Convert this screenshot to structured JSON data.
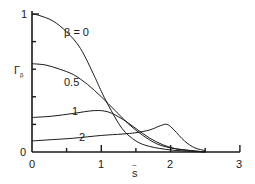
{
  "chart_data": {
    "type": "line",
    "title": "",
    "xlabel": "s̄",
    "ylabel": "Γ_β",
    "xlim": [
      0,
      3
    ],
    "ylim": [
      0,
      1
    ],
    "x_ticks": [
      0,
      1,
      2,
      3
    ],
    "x_minor_ticks": [
      0.5,
      1.5,
      2.5
    ],
    "y_ticks_labeled": [
      0,
      1
    ],
    "y_minor_ticks": [
      0.2,
      0.4,
      0.6,
      0.8
    ],
    "grid": false,
    "legend": "inline curve labels",
    "series": [
      {
        "name": "β = 0",
        "label": "β = 0",
        "x": [
          0,
          0.1,
          0.3,
          0.5,
          0.7,
          0.9,
          1.0,
          1.1,
          1.3,
          1.5,
          1.7,
          2.0,
          2.3,
          2.5
        ],
        "y": [
          1.0,
          0.99,
          0.95,
          0.87,
          0.75,
          0.55,
          0.44,
          0.34,
          0.17,
          0.08,
          0.04,
          0.015,
          0.005,
          0.0
        ]
      },
      {
        "name": "β = 0.5",
        "label": "0.5",
        "x": [
          0,
          0.2,
          0.4,
          0.6,
          0.8,
          1.0,
          1.2,
          1.4,
          1.6,
          1.8,
          2.0,
          2.3,
          2.5
        ],
        "y": [
          0.64,
          0.63,
          0.6,
          0.56,
          0.49,
          0.4,
          0.3,
          0.2,
          0.12,
          0.06,
          0.03,
          0.01,
          0.0
        ]
      },
      {
        "name": "β = 1",
        "label": "1",
        "x": [
          0,
          0.3,
          0.6,
          0.9,
          1.1,
          1.3,
          1.5,
          1.7,
          1.9,
          2.1,
          2.3,
          2.5
        ],
        "y": [
          0.25,
          0.26,
          0.28,
          0.3,
          0.29,
          0.24,
          0.17,
          0.1,
          0.05,
          0.02,
          0.01,
          0.0
        ]
      },
      {
        "name": "β = 2",
        "label": "2",
        "x": [
          0,
          0.3,
          0.6,
          1.0,
          1.3,
          1.5,
          1.7,
          1.85,
          1.95,
          2.05,
          2.2,
          2.35,
          2.5
        ],
        "y": [
          0.08,
          0.09,
          0.1,
          0.12,
          0.13,
          0.14,
          0.16,
          0.19,
          0.2,
          0.16,
          0.08,
          0.03,
          0.01
        ]
      }
    ]
  },
  "labels": {
    "y_axis_title": "Γ",
    "y_axis_sub": "β",
    "x_axis_title": "s",
    "x_axis_decor": "~",
    "y_tick_top": "1",
    "y_tick_bottom": "0",
    "x_tick_0": "0",
    "x_tick_1": "1",
    "x_tick_2": "2",
    "x_tick_3": "3",
    "curve_b0": "β = 0",
    "curve_b05": "0.5",
    "curve_b1": "1",
    "curve_b2": "2"
  },
  "colors": {
    "line": "#1a1a1a",
    "background": "#ffffff"
  }
}
